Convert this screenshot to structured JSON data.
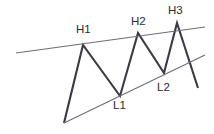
{
  "diagram": {
    "background_color": "#ffffff",
    "price_line_color": "#3a3a46",
    "trendline_color": "#6e6e78",
    "label_color": "#2b2b33",
    "labels": {
      "h1": "H1",
      "h2": "H2",
      "h3": "H3",
      "l1": "L1",
      "l2": "L2"
    }
  },
  "chart_data": {
    "type": "line",
    "xlabel": "",
    "ylabel": "",
    "xlim": [
      0,
      214
    ],
    "ylim": [
      0,
      134
    ],
    "grid": false,
    "legend": null,
    "series": [
      {
        "name": "price-path",
        "points": [
          {
            "x": 64,
            "y": 123,
            "label": ""
          },
          {
            "x": 83,
            "y": 45,
            "label": "H1"
          },
          {
            "x": 120,
            "y": 96,
            "label": "L1"
          },
          {
            "x": 138,
            "y": 33,
            "label": "H2"
          },
          {
            "x": 164,
            "y": 73,
            "label": "L2"
          },
          {
            "x": 177,
            "y": 23,
            "label": "H3"
          },
          {
            "x": 198,
            "y": 88,
            "label": ""
          }
        ]
      },
      {
        "name": "upper-trendline",
        "points": [
          {
            "x": 16,
            "y": 53
          },
          {
            "x": 205,
            "y": 27
          }
        ]
      },
      {
        "name": "lower-trendline",
        "points": [
          {
            "x": 64,
            "y": 123
          },
          {
            "x": 205,
            "y": 55
          }
        ]
      }
    ],
    "annotations": [
      {
        "text": "H1",
        "x": 76,
        "y": 24,
        "anchor_point": {
          "x": 83,
          "y": 45
        }
      },
      {
        "text": "H2",
        "x": 131,
        "y": 16,
        "anchor_point": {
          "x": 138,
          "y": 33
        }
      },
      {
        "text": "H3",
        "x": 168,
        "y": 5,
        "anchor_point": {
          "x": 177,
          "y": 23
        }
      },
      {
        "text": "L1",
        "x": 113,
        "y": 100,
        "anchor_point": {
          "x": 120,
          "y": 96
        }
      },
      {
        "text": "L2",
        "x": 157,
        "y": 82,
        "anchor_point": {
          "x": 164,
          "y": 73
        }
      }
    ]
  }
}
